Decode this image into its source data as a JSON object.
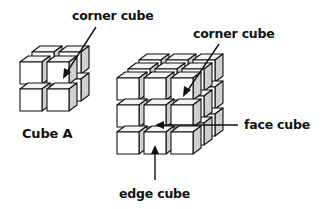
{
  "diagram": {
    "background": "#ffffff",
    "line_color": "#111111",
    "cube_face_color": "#ffffff",
    "cube_side_color": "#cfcfcf",
    "cube_top_color": "#f4f4f4",
    "labels": {
      "corner_cube_a": "corner cube",
      "cube_a": "Cube A",
      "corner_cube_b": "corner cube",
      "face_cube": "face cube",
      "edge_cube": "edge cube"
    },
    "cube_a": {
      "size": 2,
      "name": "Cube A"
    },
    "cube_b": {
      "size": 3
    }
  }
}
